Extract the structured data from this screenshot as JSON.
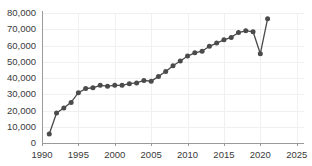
{
  "chart_data": {
    "type": "line",
    "title": "",
    "subtitle": "",
    "xlabel": "",
    "ylabel": "",
    "xlim": [
      1990,
      2026
    ],
    "ylim": [
      0,
      80000
    ],
    "grid": true,
    "legend": "none",
    "marker": "circle",
    "line_color": "#4a4a4a",
    "marker_color": "#4b4b4b",
    "grid_color": "#f0f0f0",
    "axis_color": "#9a9a9a",
    "text_color": "#3a3a3a",
    "background": "#ffffff",
    "x_ticks": [
      1990,
      1995,
      2000,
      2005,
      2010,
      2015,
      2020,
      2025
    ],
    "x_tick_labels": [
      "1990",
      "1995",
      "2000",
      "2005",
      "2010",
      "2015",
      "2020",
      "2025"
    ],
    "y_ticks": [
      0,
      10000,
      20000,
      30000,
      40000,
      50000,
      60000,
      70000,
      80000
    ],
    "y_tick_labels": [
      "0",
      "10,000",
      "20,000",
      "30,000",
      "40,000",
      "50,000",
      "60,000",
      "70,000",
      "80,000"
    ],
    "series": [
      {
        "name": "series-1",
        "x": [
          1991,
          1992,
          1993,
          1994,
          1995,
          1996,
          1997,
          1998,
          1999,
          2000,
          2001,
          2002,
          2003,
          2004,
          2005,
          2006,
          2007,
          2008,
          2009,
          2010,
          2011,
          2012,
          2013,
          2014,
          2015,
          2016,
          2017,
          2018,
          2019,
          2020,
          2021
        ],
        "values": [
          5500,
          18500,
          21500,
          25000,
          31000,
          33500,
          34000,
          35500,
          35000,
          35500,
          35500,
          36500,
          37000,
          38500,
          38000,
          41000,
          44000,
          47500,
          50500,
          53500,
          55500,
          56500,
          59500,
          61500,
          63500,
          65000,
          68000,
          69000,
          68500,
          55000,
          76500
        ]
      }
    ]
  }
}
